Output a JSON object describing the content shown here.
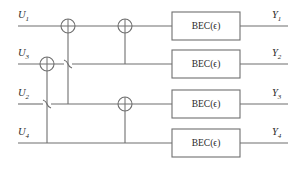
{
  "diagram": {
    "line_color": "#6f6f6f",
    "text_color": "#2a2a2a",
    "background": "#ffffff"
  },
  "inputs": [
    {
      "label": "U",
      "sub": "1",
      "y": 26
    },
    {
      "label": "U",
      "sub": "3",
      "y": 64
    },
    {
      "label": "U",
      "sub": "2",
      "y": 104
    },
    {
      "label": "U",
      "sub": "4",
      "y": 143
    }
  ],
  "outputs": [
    {
      "label": "Y",
      "sub": "1",
      "y": 26
    },
    {
      "label": "Y",
      "sub": "2",
      "y": 64
    },
    {
      "label": "Y",
      "sub": "3",
      "y": 104
    },
    {
      "label": "Y",
      "sub": "4",
      "y": 143
    }
  ],
  "channels": [
    {
      "name": "BEC",
      "arg": "ϵ",
      "text": "BEC(ϵ)",
      "row": 1
    },
    {
      "name": "BEC",
      "arg": "ϵ",
      "text": "BEC(ϵ)",
      "row": 2
    },
    {
      "name": "BEC",
      "arg": "ϵ",
      "text": "BEC(ϵ)",
      "row": 3
    },
    {
      "name": "BEC",
      "arg": "ϵ",
      "text": "BEC(ϵ)",
      "row": 4
    }
  ],
  "xor_gates": [
    {
      "id": "xor-row1-a",
      "x": 68,
      "y": 26,
      "row": 1
    },
    {
      "id": "xor-row1-b",
      "x": 125,
      "y": 26,
      "row": 1
    },
    {
      "id": "xor-row2-a",
      "x": 47,
      "y": 64,
      "row": 2
    },
    {
      "id": "xor-row3-a",
      "x": 125,
      "y": 104,
      "row": 3
    }
  ],
  "control_lines": [
    {
      "id": "ctrl-68-row1-to-row3",
      "x": 68,
      "from_y": 26,
      "to_y": 104
    },
    {
      "id": "ctrl-125-row1-to-row2",
      "x": 125,
      "from_y": 26,
      "to_y": 64
    },
    {
      "id": "ctrl-47-row2-to-row4",
      "x": 47,
      "from_y": 64,
      "to_y": 143
    },
    {
      "id": "ctrl-125-row3-to-row4",
      "x": 125,
      "from_y": 104,
      "to_y": 143
    }
  ],
  "wire_hops": [
    {
      "id": "hop-row2-x68",
      "x": 68,
      "y": 64
    },
    {
      "id": "hop-row3-x47",
      "x": 47,
      "y": 104
    }
  ],
  "geometry": {
    "wire_start_x": 18,
    "wire_end_x": 288,
    "box_left": 172,
    "box_right": 240,
    "box_half_height": 14,
    "gate_radius": 7
  }
}
